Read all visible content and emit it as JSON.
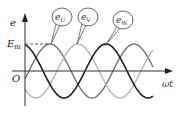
{
  "figure": {
    "type": "three-phase sine waveform",
    "axes": {
      "y_label": "e",
      "x_label": "ωt",
      "origin_label": "O",
      "amplitude_label_main": "E",
      "amplitude_label_sub": "m"
    },
    "series": [
      {
        "name": "e_U",
        "label_main": "e",
        "label_sub": "U",
        "color": "#6f6f6f",
        "phase_deg": 0
      },
      {
        "name": "e_V",
        "label_main": "e",
        "label_sub": "V",
        "color": "#b4b4b4",
        "phase_deg": -120
      },
      {
        "name": "e_W",
        "label_main": "e",
        "label_sub": "W",
        "color": "#1e1e1e",
        "phase_deg": -240
      }
    ],
    "colors": {
      "axis": "#333333",
      "dashed_line": "#444444",
      "callout_border": "#555555"
    }
  }
}
